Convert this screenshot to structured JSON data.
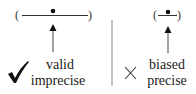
{
  "left_panel": {
    "interval": {
      "open": "(",
      "close": ")"
    },
    "verdict_icon": "checkmark-icon",
    "verdict_glyph": "✔",
    "label_line1": "valid",
    "label_line2": "imprecise"
  },
  "right_panel": {
    "interval": {
      "open": "(",
      "close": ")"
    },
    "verdict_icon": "cross-icon",
    "verdict_glyph": "×",
    "label_line1": "biased",
    "label_line2": "precise"
  },
  "colors": {
    "ink": "#1a1a1a",
    "divider": "#888888"
  }
}
